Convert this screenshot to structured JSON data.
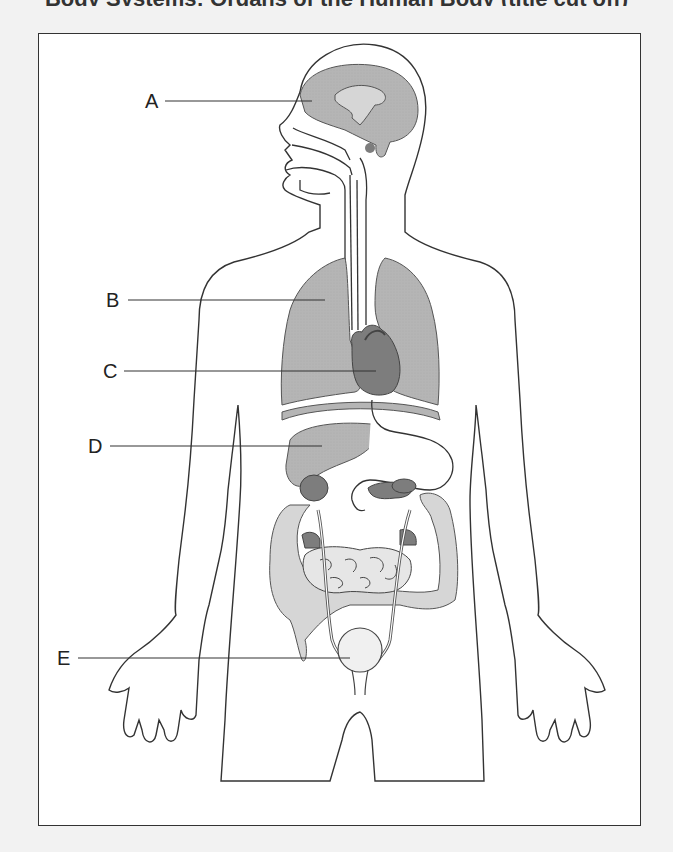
{
  "title": {
    "text": "Body Systems: Organs of the Human Body (title cut off)"
  },
  "diagram": {
    "colors": {
      "outline": "#333333",
      "organ_fill": "#b5b5b5",
      "organ_dark": "#7d7d7d",
      "organ_light": "#d6d6d6",
      "frame_bg": "#ffffff",
      "page_bg": "#f2f2f2"
    },
    "labels": [
      {
        "id": "A",
        "text": "A",
        "points_to": "brain",
        "x": 145,
        "y": 91,
        "line": [
          165,
          101,
          312,
          101
        ]
      },
      {
        "id": "B",
        "text": "B",
        "points_to": "lung",
        "x": 106,
        "y": 290,
        "line": [
          128,
          300,
          325,
          300
        ]
      },
      {
        "id": "C",
        "text": "C",
        "points_to": "heart",
        "x": 103,
        "y": 361,
        "line": [
          124,
          371,
          376,
          371
        ]
      },
      {
        "id": "D",
        "text": "D",
        "points_to": "liver",
        "x": 88,
        "y": 436,
        "line": [
          110,
          446,
          322,
          446
        ]
      },
      {
        "id": "E",
        "text": "E",
        "points_to": "bladder",
        "x": 57,
        "y": 648,
        "line": [
          78,
          658,
          350,
          658
        ]
      }
    ]
  }
}
